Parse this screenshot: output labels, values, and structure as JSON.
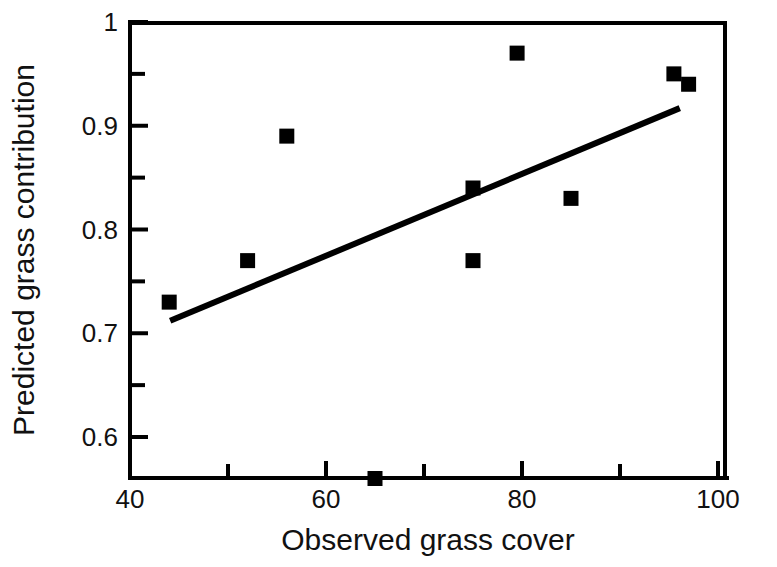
{
  "chart_data": {
    "type": "scatter",
    "title": "",
    "xlabel": "Observed grass cover",
    "ylabel": "Predicted grass contribution",
    "xlim": [
      36,
      102
    ],
    "ylim": [
      0.555,
      1.0
    ],
    "grid": false,
    "legend": "none",
    "marker": "filled-square",
    "marker_color": "#000000",
    "x": [
      44,
      52,
      56,
      65,
      75,
      75,
      79.5,
      85,
      95.5,
      97
    ],
    "y": [
      0.73,
      0.77,
      0.89,
      0.56,
      0.84,
      0.77,
      0.97,
      0.83,
      0.95,
      0.94
    ],
    "points": [
      {
        "x": 44,
        "y": 0.73
      },
      {
        "x": 52,
        "y": 0.77
      },
      {
        "x": 56,
        "y": 0.89
      },
      {
        "x": 65,
        "y": 0.56
      },
      {
        "x": 75,
        "y": 0.84
      },
      {
        "x": 75,
        "y": 0.77
      },
      {
        "x": 79.5,
        "y": 0.97
      },
      {
        "x": 85,
        "y": 0.83
      },
      {
        "x": 95.5,
        "y": 0.95
      },
      {
        "x": 97,
        "y": 0.94
      }
    ],
    "trendline": {
      "type": "line",
      "x": [
        44.1,
        96.1
      ],
      "y": [
        0.712,
        0.917
      ],
      "color": "#000000"
    },
    "xticks": [
      40,
      60,
      80,
      100
    ],
    "xtick_labels": [
      "40",
      "60",
      "80",
      "100"
    ],
    "xminor_ticks": [
      50,
      70,
      90
    ],
    "yticks": [
      0.6,
      0.7,
      0.8,
      0.9,
      1.0
    ],
    "ytick_labels": [
      "0.6",
      "0.7",
      "0.8",
      "0.9",
      "1"
    ],
    "yminor_ticks": [
      0.65,
      0.75,
      0.85,
      0.95
    ],
    "axis_color": "#000000"
  },
  "axes": {
    "x_title": "Observed grass cover",
    "y_title": "Predicted grass contribution"
  },
  "xtick_labels": {
    "t0": "40",
    "t1": "60",
    "t2": "80",
    "t3": "100"
  },
  "ytick_labels": {
    "t0": "1",
    "t1": "0.9",
    "t2": "0.8",
    "t3": "0.7",
    "t4": "0.6"
  }
}
